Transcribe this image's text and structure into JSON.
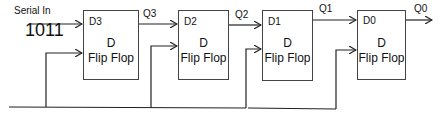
{
  "diagram": {
    "input": {
      "label": "Serial In",
      "value": "1011"
    },
    "flip_flops": [
      {
        "id": "ff3",
        "input_pin": "D3",
        "line1": "D",
        "line2": "Flip Flop",
        "output": "Q3"
      },
      {
        "id": "ff2",
        "input_pin": "D2",
        "line1": "D",
        "line2": "Flip Flop",
        "output": "Q2"
      },
      {
        "id": "ff1",
        "input_pin": "D1",
        "line1": "D",
        "line2": "Flip Flop",
        "output": "Q1"
      },
      {
        "id": "ff0",
        "input_pin": "D0",
        "line1": "D",
        "line2": "Flip Flop",
        "output": "Q0"
      }
    ],
    "colors": {
      "line": "#222222",
      "box_border": "#444444",
      "background": "#ffffff"
    }
  }
}
